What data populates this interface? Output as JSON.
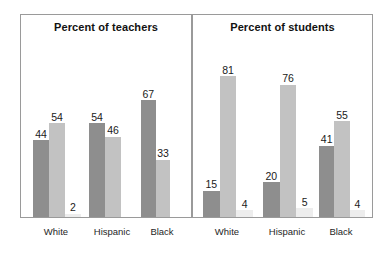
{
  "chart_data": {
    "type": "bar",
    "title": "",
    "xlabel": "",
    "ylabel": "",
    "ylim": [
      0,
      100
    ],
    "grid": false,
    "legend": "none",
    "categories": [
      "White",
      "Hispanic",
      "Black"
    ],
    "panels": [
      {
        "title": "Percent of teachers",
        "categories": [
          "White",
          "Hispanic",
          "Black"
        ],
        "series": [
          {
            "name": "series-1",
            "color": "#8e8e8e",
            "values": [
              44,
              54,
              67
            ]
          },
          {
            "name": "series-2",
            "color": "#c2c2c2",
            "values": [
              54,
              46,
              33
            ]
          },
          {
            "name": "series-3",
            "color": "#ededed",
            "values": [
              2,
              0,
              0
            ]
          }
        ],
        "labels": [
          [
            "44",
            "54",
            "2"
          ],
          [
            "54",
            "46",
            ""
          ],
          [
            "67",
            "33",
            ""
          ]
        ]
      },
      {
        "title": "Percent of students",
        "categories": [
          "White",
          "Hispanic",
          "Black"
        ],
        "series": [
          {
            "name": "series-1",
            "color": "#8e8e8e",
            "values": [
              15,
              20,
              41
            ]
          },
          {
            "name": "series-2",
            "color": "#c2c2c2",
            "values": [
              81,
              76,
              55
            ]
          },
          {
            "name": "series-3",
            "color": "#ededed",
            "values": [
              4,
              5,
              4
            ]
          }
        ],
        "labels": [
          [
            "15",
            "81",
            "4"
          ],
          [
            "20",
            "76",
            "5"
          ],
          [
            "41",
            "55",
            "4"
          ]
        ]
      }
    ]
  },
  "panels": {
    "left": {
      "title": "Percent of teachers",
      "groups": [
        {
          "label": "White",
          "bars": [
            {
              "value": 44,
              "label": "44",
              "color": "#8e8e8e"
            },
            {
              "value": 54,
              "label": "54",
              "color": "#c2c2c2"
            },
            {
              "value": 2,
              "label": "2",
              "color": "#ededed"
            }
          ]
        },
        {
          "label": "Hispanic",
          "bars": [
            {
              "value": 54,
              "label": "54",
              "color": "#8e8e8e"
            },
            {
              "value": 46,
              "label": "46",
              "color": "#c2c2c2"
            },
            {
              "value": 0,
              "label": "",
              "color": "#ededed"
            }
          ]
        },
        {
          "label": "Black",
          "bars": [
            {
              "value": 67,
              "label": "67",
              "color": "#8e8e8e"
            },
            {
              "value": 33,
              "label": "33",
              "color": "#c2c2c2"
            },
            {
              "value": 0,
              "label": "",
              "color": "#ededed"
            }
          ]
        }
      ]
    },
    "right": {
      "title": "Percent of students",
      "groups": [
        {
          "label": "White",
          "bars": [
            {
              "value": 15,
              "label": "15",
              "color": "#8e8e8e"
            },
            {
              "value": 81,
              "label": "81",
              "color": "#c2c2c2"
            },
            {
              "value": 4,
              "label": "4",
              "color": "#ededed"
            }
          ]
        },
        {
          "label": "Hispanic",
          "bars": [
            {
              "value": 20,
              "label": "20",
              "color": "#8e8e8e"
            },
            {
              "value": 76,
              "label": "76",
              "color": "#c2c2c2"
            },
            {
              "value": 5,
              "label": "5",
              "color": "#ededed"
            }
          ]
        },
        {
          "label": "Black",
          "bars": [
            {
              "value": 41,
              "label": "41",
              "color": "#8e8e8e"
            },
            {
              "value": 55,
              "label": "55",
              "color": "#c2c2c2"
            },
            {
              "value": 4,
              "label": "4",
              "color": "#ededed"
            }
          ]
        }
      ]
    }
  },
  "style": {
    "panel_border": "#9a9a9a",
    "background": "#ffffff",
    "label_color": "#1a1a1a",
    "axis_label_color": "#262626",
    "y_max": 100
  }
}
